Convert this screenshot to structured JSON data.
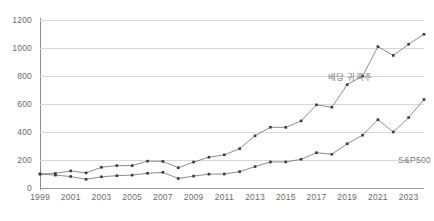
{
  "chart_data": {
    "type": "line",
    "title": "",
    "subtitle": "",
    "xlabel": "",
    "ylabel": "",
    "xlim": [
      1999,
      2024
    ],
    "ylim": [
      0,
      1200
    ],
    "y_ticks": [
      0,
      200,
      400,
      600,
      800,
      1000,
      1200
    ],
    "x_ticks": [
      1999,
      2001,
      2003,
      2005,
      2007,
      2009,
      2011,
      2013,
      2015,
      2017,
      2019,
      2021,
      2023
    ],
    "x": [
      1999,
      2000,
      2001,
      2002,
      2003,
      2004,
      2005,
      2006,
      2007,
      2008,
      2009,
      2010,
      2011,
      2012,
      2013,
      2014,
      2015,
      2016,
      2017,
      2018,
      2019,
      2020,
      2021,
      2022,
      2023,
      2024
    ],
    "grid": true,
    "grid_axis": "y",
    "legend": "inline-annotations",
    "markers": true,
    "series": [
      {
        "name": "배당 귀족주",
        "color": "#6e6e6e",
        "annotation_label": "배당 귀족주",
        "values": [
          100,
          104,
          122,
          108,
          148,
          160,
          160,
          192,
          190,
          145,
          185,
          220,
          237,
          281,
          373,
          434,
          433,
          479,
          594,
          577,
          738,
          800,
          1010,
          947,
          1027,
          1098
        ]
      },
      {
        "name": "S&P500",
        "color": "#6e6e6e",
        "annotation_label": "S&P500",
        "values": [
          100,
          92,
          82,
          62,
          80,
          88,
          92,
          105,
          112,
          68,
          85,
          99,
          100,
          117,
          153,
          186,
          186,
          205,
          252,
          241,
          316,
          377,
          488,
          400,
          503,
          632
        ]
      }
    ],
    "annotations": [
      {
        "text": "배당 귀족주",
        "target_series": "배당 귀족주"
      },
      {
        "text": "S&P500",
        "target_series": "S&P500"
      }
    ],
    "colors": {
      "line": "#6e6e6e",
      "marker": "#3a3a3a",
      "gridline": "#d8d8d8",
      "axis": "#8c8c8c",
      "tick_text": "#6b6b6b",
      "annotation_text": "#7a7a7a",
      "background": "#ffffff"
    }
  }
}
